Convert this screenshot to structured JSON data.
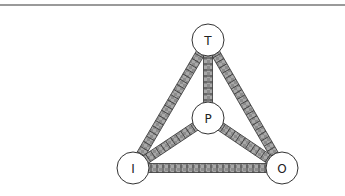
{
  "diagram": {
    "type": "tetrahedral-graph",
    "nodes": [
      {
        "id": "T",
        "label": "T",
        "x": 208,
        "y": 40
      },
      {
        "id": "P",
        "label": "P",
        "x": 208,
        "y": 118
      },
      {
        "id": "I",
        "label": "I",
        "x": 133,
        "y": 168
      },
      {
        "id": "O",
        "label": "O",
        "x": 282,
        "y": 168
      }
    ],
    "edges": [
      {
        "from": "T",
        "to": "I"
      },
      {
        "from": "T",
        "to": "O"
      },
      {
        "from": "T",
        "to": "P"
      },
      {
        "from": "P",
        "to": "I"
      },
      {
        "from": "P",
        "to": "O"
      },
      {
        "from": "I",
        "to": "O"
      }
    ],
    "colors": {
      "edge_fill": "#8c8c8c",
      "edge_hatch": "#3a3a3a",
      "node_fill": "#ffffff",
      "node_stroke": "#333333",
      "rule": "#9a9a9a"
    }
  }
}
